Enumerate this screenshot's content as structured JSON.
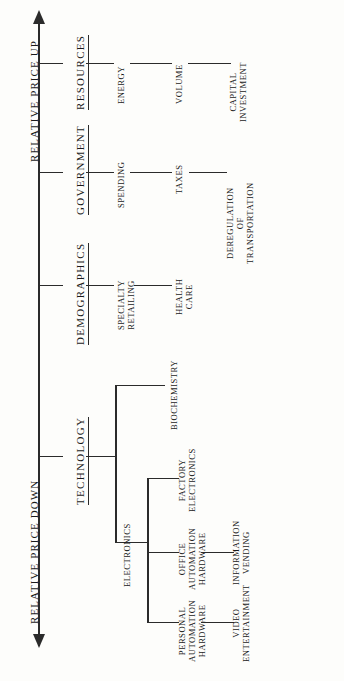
{
  "diagram": {
    "axis": {
      "left_label": "RELATIVE PRICE DOWN",
      "right_label": "RELATIVE PRICE UP"
    },
    "branches": [
      {
        "id": "technology",
        "category": "TECHNOLOGY",
        "children": [
          {
            "label": "BIOCHEMISTRY"
          },
          {
            "label": "ELECTRONICS",
            "children": [
              {
                "label": "FACTORY\nELECTRONICS"
              },
              {
                "label": "OFFICE\nAUTOMATION HARDWARE",
                "chain": "INFORMATION\nVENDING"
              },
              {
                "label": "PERSONAL\nAUTOMATION HARDWARE",
                "chain": "VIDEO\nENTERTAINMENT"
              }
            ]
          }
        ]
      },
      {
        "id": "demographics",
        "category": "DEMOGRAPHICS",
        "chain": [
          "SPECIALTY\nRETAILING",
          "HEALTH\nCARE"
        ]
      },
      {
        "id": "government",
        "category": "GOVERNMENT",
        "chain": [
          "SPENDING",
          "TAXES",
          "DEREGULATION\nOF\nTRANSPORTATION"
        ]
      },
      {
        "id": "resources",
        "category": "RESOURCES",
        "chain": [
          "ENERGY",
          "VOLUME",
          "CAPITAL\nINVESTMENT"
        ]
      }
    ],
    "labels": {
      "technology": "TECHNOLOGY",
      "demographics": "DEMOGRAPHICS",
      "government": "GOVERNMENT",
      "resources": "RESOURCES",
      "biochemistry": "BIOCHEMISTRY",
      "electronics": "ELECTRONICS",
      "factory_electronics": "FACTORY ELECTRONICS",
      "office_automation": "OFFICE AUTOMATION HARDWARE",
      "personal_automation": "PERSONAL AUTOMATION HARDWARE",
      "information_vending": "INFORMATION VENDING",
      "video_entertainment": "VIDEO ENTERTAINMENT",
      "specialty_retailing": "SPECIALTY RETAILING",
      "health_care": "HEALTH CARE",
      "spending": "SPENDING",
      "taxes": "TAXES",
      "deregulation": "DEREGULATION OF TRANSPORTATION",
      "energy": "ENERGY",
      "volume": "VOLUME",
      "capital_investment": "CAPITAL INVESTMENT"
    },
    "colors": {
      "ink": "#2b2b2b",
      "paper": "#fdfdfb"
    }
  }
}
